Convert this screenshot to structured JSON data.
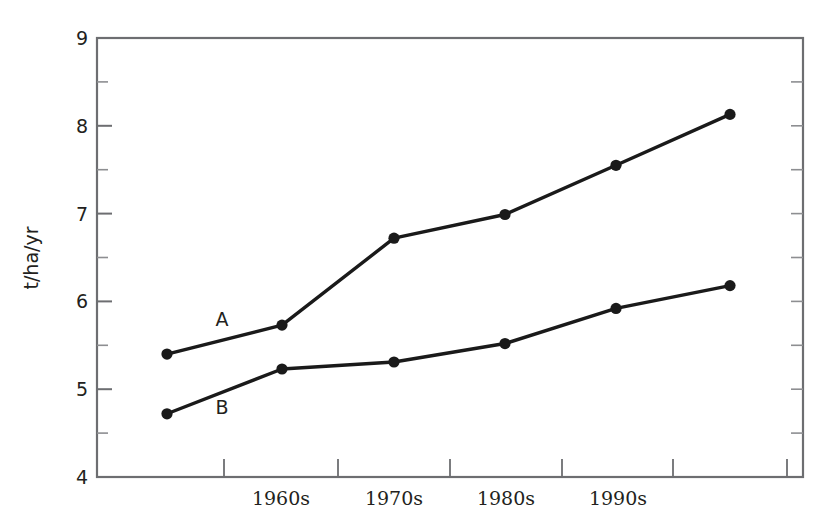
{
  "chart_data": {
    "type": "line",
    "title": "",
    "xlabel": "",
    "ylabel": "t/ha/yr",
    "ylim": [
      4,
      9
    ],
    "yticks": [
      4,
      5,
      6,
      7,
      8,
      9
    ],
    "ytick_labels": [
      "4",
      "5",
      "6",
      "7",
      "8",
      "9"
    ],
    "yminor_ticks": [
      4.5,
      5.5,
      6.5,
      7.5,
      8.5
    ],
    "grid": false,
    "legend": "inline-labels",
    "legend_position": "inline",
    "xtick_labels": [
      "1960s",
      "1970s",
      "1980s",
      "1990s"
    ],
    "x_positions_px": [
      167,
      282,
      394,
      505,
      616,
      730
    ],
    "x_major_tick_px": [
      224,
      338,
      450,
      562,
      673,
      787
    ],
    "x_label_px": [
      281,
      394,
      506,
      618
    ],
    "series": [
      {
        "name": "A",
        "label": "A",
        "color": "#1a1a1a",
        "marker": "circle",
        "values": [
          5.4,
          5.73,
          6.72,
          6.99,
          7.55,
          8.13
        ]
      },
      {
        "name": "B",
        "label": "B",
        "color": "#1a1a1a",
        "marker": "circle",
        "values": [
          4.72,
          5.23,
          5.31,
          5.52,
          5.92,
          6.18
        ]
      }
    ],
    "annotations": [
      {
        "text": "A",
        "x_px": 222,
        "y_px": 326
      },
      {
        "text": "B",
        "x_px": 222,
        "y_px": 414
      }
    ],
    "colors": {
      "line": "#1a1a1a",
      "axis": "#58595b",
      "text": "#231f20",
      "background": "#ffffff"
    }
  },
  "axes": {
    "y_title": "t/ha/yr",
    "y_tick_0": "4",
    "y_tick_1": "5",
    "y_tick_2": "6",
    "y_tick_3": "7",
    "y_tick_4": "8",
    "y_tick_5": "9",
    "x_tick_0": "1960s",
    "x_tick_1": "1970s",
    "x_tick_2": "1980s",
    "x_tick_3": "1990s"
  },
  "series_labels": {
    "a": "A",
    "b": "B"
  }
}
